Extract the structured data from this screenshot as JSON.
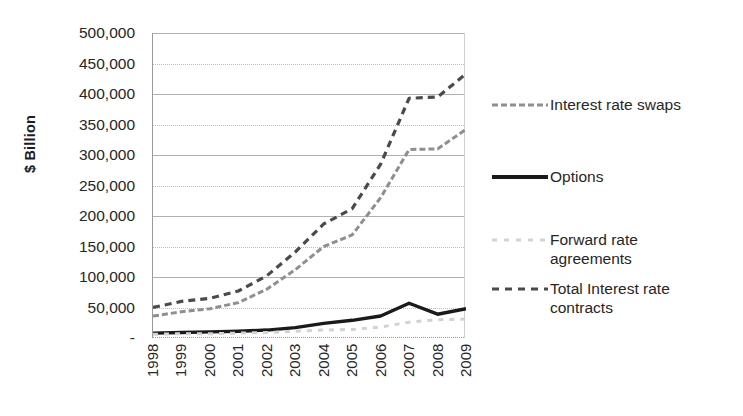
{
  "chart_data": {
    "type": "line",
    "title": "",
    "xlabel": "",
    "ylabel": "$ Billion",
    "ylim": [
      0,
      500000
    ],
    "grid": true,
    "legend_position": "right",
    "categories": [
      "1998",
      "1999",
      "2000",
      "2001",
      "2002",
      "2003",
      "2004",
      "2005",
      "2006",
      "2007",
      "2008",
      "2009"
    ],
    "y_ticks": [
      "500,000",
      "450,000",
      "400,000",
      "350,000",
      "300,000",
      "250,000",
      "200,000",
      "150,000",
      "100,000",
      "50,000",
      "-"
    ],
    "y_tick_values": [
      500000,
      450000,
      400000,
      350000,
      300000,
      250000,
      200000,
      150000,
      100000,
      50000,
      0
    ],
    "series": [
      {
        "name": "Interest rate swaps",
        "color": "#8f8f8f",
        "dash": "6,3",
        "width": 3,
        "values": [
          36000,
          43000,
          48000,
          58000,
          80000,
          112000,
          150000,
          169000,
          230000,
          309000,
          310000,
          342000
        ]
      },
      {
        "name": "Options",
        "color": "#1a1a1a",
        "dash": "none",
        "width": 3.4,
        "values": [
          8000,
          9000,
          10000,
          11000,
          13000,
          17000,
          24000,
          29000,
          36000,
          57000,
          39000,
          48000
        ]
      },
      {
        "name": "Forward rate\nagreements",
        "color": "#d2d2d2",
        "dash": "5,6",
        "width": 3,
        "values": [
          6000,
          7000,
          7000,
          8000,
          9000,
          11000,
          13000,
          14000,
          18000,
          26000,
          30000,
          31000
        ]
      },
      {
        "name": "Total Interest rate\ncontracts",
        "color": "#4a4a4a",
        "dash": "7,5",
        "width": 3.2,
        "values": [
          50000,
          60000,
          65000,
          77000,
          102000,
          141000,
          187000,
          212000,
          285000,
          393000,
          395000,
          433000
        ]
      }
    ]
  },
  "legend": {
    "items": [
      {
        "label": "Interest rate swaps",
        "color": "#8f8f8f",
        "dash": "6,3",
        "width": 3
      },
      {
        "label": "Options",
        "color": "#1a1a1a",
        "dash": "none",
        "width": 4
      },
      {
        "label": "Forward rate\nagreements",
        "color": "#d2d2d2",
        "dash": "5,7",
        "width": 3
      },
      {
        "label": "Total Interest rate\ncontracts",
        "color": "#4a4a4a",
        "dash": "7,6",
        "width": 3.2
      }
    ]
  }
}
